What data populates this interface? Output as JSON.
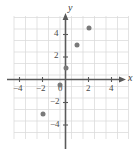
{
  "chart_data": {
    "type": "scatter",
    "title": "",
    "xlabel": "x",
    "ylabel": "y",
    "xlim": [
      -5,
      5
    ],
    "ylim": [
      -5,
      5
    ],
    "grid": true,
    "legend": null,
    "x_ticks": [
      -4,
      -2,
      0,
      2,
      4
    ],
    "y_ticks": [
      4,
      2,
      -2,
      -4
    ],
    "x_tick_labels": [
      "−4",
      "−2",
      "0",
      "2",
      "4"
    ],
    "y_tick_labels": [
      "4",
      "2",
      "−2",
      "−4"
    ],
    "point_color": "#7a7a7a",
    "axis_color": "#5a5a5a",
    "grid_color": "#dcdcdc",
    "points": [
      {
        "x": 2,
        "y": 4.5
      },
      {
        "x": 1,
        "y": 3
      },
      {
        "x": 0,
        "y": 1
      },
      {
        "x": -0.5,
        "y": -0.5
      },
      {
        "x": -2,
        "y": -3
      }
    ]
  }
}
